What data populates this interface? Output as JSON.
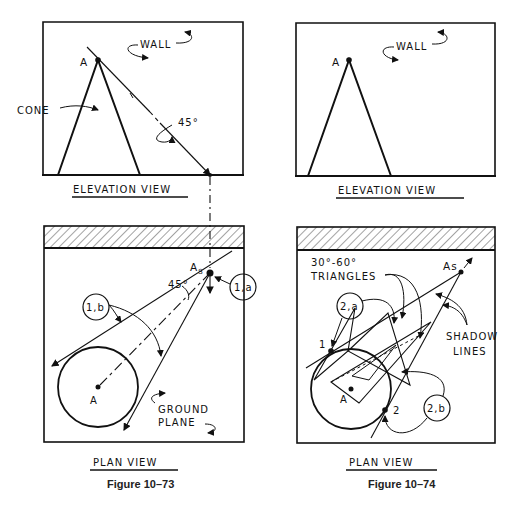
{
  "figures": [
    {
      "caption": "Figure 10–73",
      "elevation": {
        "title": "ELEVATION VIEW",
        "labels": {
          "point": "A",
          "wall": "WALL",
          "cone": "CONE",
          "angle": "45°"
        }
      },
      "plan": {
        "title": "PLAN VIEW",
        "labels": {
          "shadow_point": "As",
          "shadow_sub": "S",
          "point": "A",
          "angle": "45°",
          "step_a": "1,a",
          "step_b": "1,b",
          "ground1": "GROUND",
          "ground2": "PLANE"
        }
      }
    },
    {
      "caption": "Figure 10–74",
      "elevation": {
        "title": "ELEVATION VIEW",
        "labels": {
          "point": "A",
          "wall": "WALL"
        }
      },
      "plan": {
        "title": "PLAN VIEW",
        "labels": {
          "shadow_point": "As",
          "point": "A",
          "tri1": "30°-60°",
          "tri2": "TRIANGLES",
          "step_a": "2,a",
          "step_b": "2,b",
          "pt1": "1",
          "pt2": "2",
          "shadow1": "SHADOW",
          "shadow2": "LINES"
        }
      }
    }
  ]
}
